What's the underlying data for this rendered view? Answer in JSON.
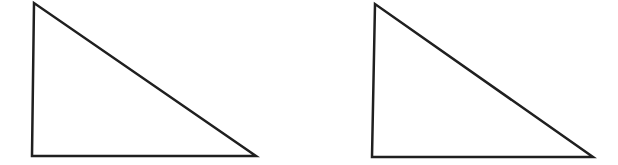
{
  "figure": {
    "background_color": "#ffffff",
    "stroke_color": "#1f1f1f",
    "stroke_width": "2.5",
    "canvas": {
      "width": "618",
      "height": "165",
      "viewbox": "0 0 618 165"
    },
    "triangles": [
      {
        "id": "triangle-left",
        "points": "34,3 32,156 256,156"
      },
      {
        "id": "triangle-right",
        "points": "375,4 372,157 593,157"
      }
    ]
  }
}
